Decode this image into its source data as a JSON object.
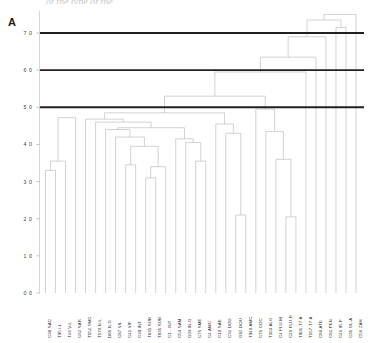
{
  "panel": {
    "letter": "A"
  },
  "clipped_title": "of the type of the",
  "chart_data": {
    "type": "dendrogram",
    "title": "",
    "xlabel": "",
    "ylabel": "",
    "ylim": [
      0.0,
      7.6
    ],
    "grid": false,
    "legend": null,
    "y_ticks": [
      "7 0",
      "6 0",
      "5 0",
      "4 0",
      "3 0",
      "2 0",
      "1 0",
      "0 0"
    ],
    "y_tick_values": [
      7.0,
      6.0,
      5.0,
      4.0,
      3.0,
      2.0,
      1.0,
      0.0
    ],
    "threshold_lines": [
      {
        "value": 7.0,
        "color": "#231f20"
      },
      {
        "value": 6.0,
        "color": "#231f20"
      },
      {
        "value": 5.0,
        "color": "#231f20"
      }
    ],
    "link_color": "#b9b9b9",
    "leaf_labels": [
      "C38 SAC",
      "T95 I-L",
      "T43 V-L",
      "C62 SAR",
      "T552 TMC",
      "T570 N-L",
      "D85 N-G",
      "C87 VIL",
      "C41 VIF",
      "C39 INT",
      "T835 SUB",
      "T835 SUB",
      "C1 - INT",
      "C53 SAM",
      "G03 IN-G",
      "C76 SME",
      "C4 AMC",
      "C10 SAE",
      "C32 DOU",
      "G82 DOU",
      "T940 AMC",
      "C76 COC",
      "T363 ALG",
      "C4 FLU-M",
      "C40 FLU-R",
      "T901-T7 A",
      "T557-T7 A",
      "C80 ATE",
      "C81 PEN",
      "C46 IR-P",
      "C35 GL-A",
      "C56 ZAH"
    ],
    "n_leaves": 32,
    "merges": [
      {
        "left": "leaf:0",
        "right": "leaf:1",
        "height": 3.3,
        "id": "m1"
      },
      {
        "left": "m1",
        "right": "leaf:2",
        "height": 3.55,
        "id": "m2"
      },
      {
        "left": "m2",
        "right": "leaf:3",
        "height": 4.72,
        "id": "m3"
      },
      {
        "left": "leaf:8",
        "right": "leaf:9",
        "height": 3.45,
        "id": "m4"
      },
      {
        "left": "leaf:10",
        "right": "leaf:11",
        "height": 3.1,
        "id": "m5"
      },
      {
        "left": "m5",
        "right": "leaf:12",
        "height": 3.4,
        "id": "m6"
      },
      {
        "left": "m4",
        "right": "m6",
        "height": 3.95,
        "id": "m7"
      },
      {
        "left": "leaf:7",
        "right": "m7",
        "height": 4.2,
        "id": "m8"
      },
      {
        "left": "leaf:6",
        "right": "m8",
        "height": 4.4,
        "id": "m9"
      },
      {
        "left": "leaf:15",
        "right": "leaf:16",
        "height": 3.55,
        "id": "m10"
      },
      {
        "left": "leaf:14",
        "right": "m10",
        "height": 4.05,
        "id": "m11"
      },
      {
        "left": "leaf:13",
        "right": "m11",
        "height": 4.15,
        "id": "m12"
      },
      {
        "left": "m9",
        "right": "m12",
        "height": 4.45,
        "id": "m13"
      },
      {
        "left": "leaf:5",
        "right": "m13",
        "height": 4.6,
        "id": "m14"
      },
      {
        "left": "leaf:4",
        "right": "m14",
        "height": 4.68,
        "id": "m15"
      },
      {
        "left": "leaf:19",
        "right": "leaf:20",
        "height": 2.1,
        "id": "m16"
      },
      {
        "left": "leaf:18",
        "right": "m16",
        "height": 4.3,
        "id": "m17"
      },
      {
        "left": "leaf:17",
        "right": "m17",
        "height": 4.55,
        "id": "m18"
      },
      {
        "left": "m15",
        "right": "m18",
        "height": 4.85,
        "id": "m19"
      },
      {
        "left": "leaf:24",
        "right": "leaf:25",
        "height": 2.05,
        "id": "m20"
      },
      {
        "left": "leaf:23",
        "right": "m20",
        "height": 3.6,
        "id": "m21"
      },
      {
        "left": "leaf:22",
        "right": "m21",
        "height": 4.35,
        "id": "m22"
      },
      {
        "left": "leaf:21",
        "right": "m22",
        "height": 4.95,
        "id": "m23"
      },
      {
        "left": "m19",
        "right": "m23",
        "height": 5.3,
        "id": "m24"
      },
      {
        "left": "m24",
        "right": "leaf:26",
        "height": 5.95,
        "id": "m25"
      },
      {
        "left": "m25",
        "right": "leaf:27",
        "height": 6.35,
        "id": "m26"
      },
      {
        "left": "m26",
        "right": "leaf:28",
        "height": 6.9,
        "id": "m27"
      },
      {
        "left": "leaf:29",
        "right": "leaf:30",
        "height": 7.15,
        "id": "m28"
      },
      {
        "left": "m27",
        "right": "m28",
        "height": 7.35,
        "id": "m29"
      },
      {
        "left": "m29",
        "right": "leaf:31",
        "height": 7.5,
        "id": "m30"
      }
    ]
  }
}
